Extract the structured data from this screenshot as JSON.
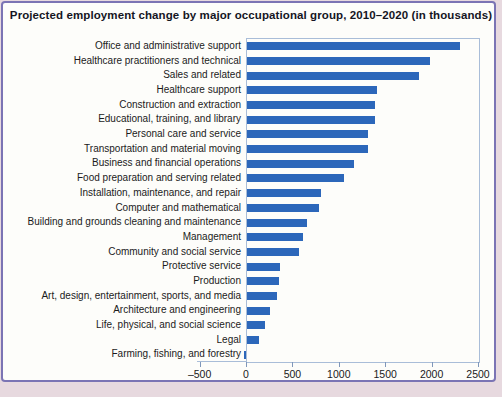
{
  "title": "Projected employment change by major occupational group, 2010–2020 (in thousands)",
  "colors": {
    "bar": "#2c67ba",
    "plot_frame": "#a9bdd8",
    "card_border": "#7b74b4",
    "page_background": "#e7d9df",
    "card_background": "#fdfdfa",
    "title_text": "#15151f",
    "label_text": "#1b1b1b"
  },
  "chart_data": {
    "type": "bar",
    "orientation": "horizontal",
    "title": "Projected employment change by major occupational group, 2010–2020 (in thousands)",
    "xlabel": "",
    "ylabel": "",
    "xlim": [
      -500,
      2500
    ],
    "grid": false,
    "legend": false,
    "categories": [
      "Office and administrative support",
      "Healthcare practitioners and technical",
      "Sales and related",
      "Healthcare support",
      "Construction and extraction",
      "Educational, training, and library",
      "Personal care and service",
      "Transportation and material moving",
      "Business and financial operations",
      "Food preparation and serving related",
      "Installation, maintenance, and repair",
      "Computer and mathematical",
      "Building and grounds cleaning and maintenance",
      "Management",
      "Community and social service",
      "Protective service",
      "Production",
      "Art, design, entertainment, sports, and media",
      "Architecture and engineering",
      "Life, physical, and social science",
      "Legal",
      "Farming, fishing, and forestry"
    ],
    "values": [
      2300,
      1975,
      1850,
      1400,
      1375,
      1375,
      1300,
      1300,
      1150,
      1050,
      800,
      775,
      650,
      600,
      560,
      355,
      345,
      325,
      250,
      190,
      130,
      -20
    ],
    "x_ticks": [
      -500,
      0,
      500,
      1000,
      1500,
      2000,
      2500
    ],
    "x_tick_labels": [
      "–500",
      "0",
      "500",
      "1000",
      "1500",
      "2000",
      "2500"
    ]
  }
}
